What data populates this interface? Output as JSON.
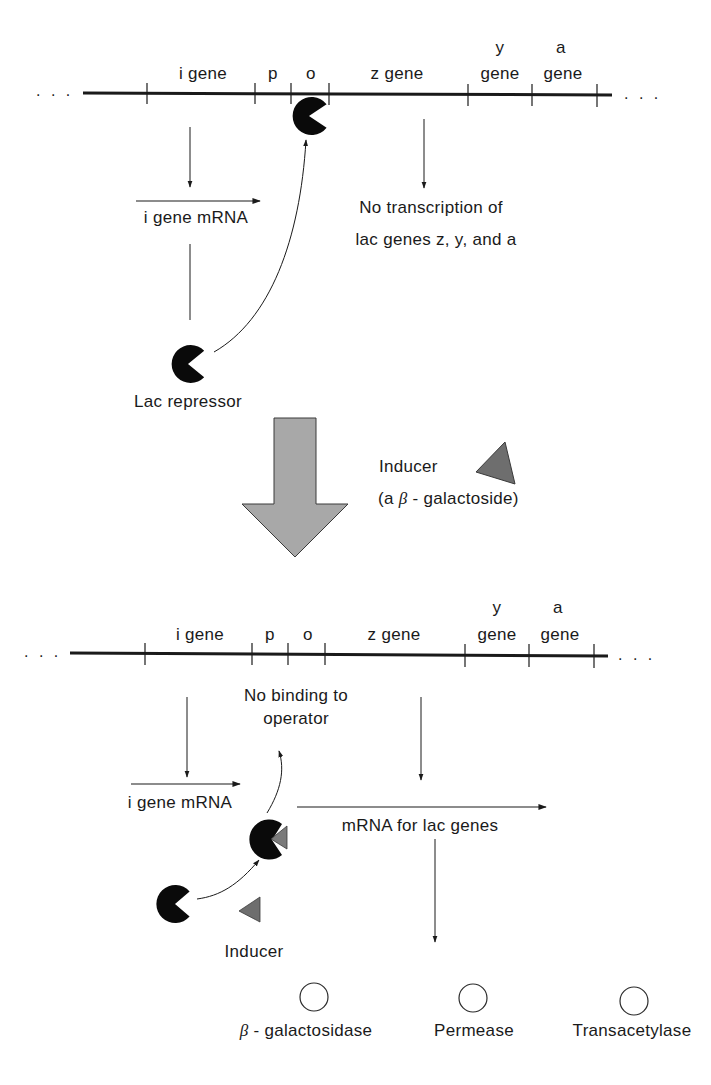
{
  "top_panel": {
    "state": "repressed",
    "dna_ends": {
      "left": ". . .",
      "right": ". . ."
    },
    "gene_labels": {
      "i": "i gene",
      "p": "p",
      "o": "o",
      "z": "z gene",
      "y_top": "y",
      "y_bottom": "gene",
      "a_top": "a",
      "a_bottom": "gene"
    },
    "i_mrna_label": "i gene mRNA",
    "repressor_label": "Lac repressor",
    "no_transcription_line1": "No transcription of",
    "no_transcription_line2": "lac genes z, y, and a"
  },
  "transition": {
    "inducer_label": "Inducer",
    "inducer_sublabel_prefix": "(a ",
    "inducer_sublabel_greek": "β",
    "inducer_sublabel_suffix": " - galactoside)",
    "arrow_color": "#a8a8a8",
    "inducer_color": "#6e6e6e"
  },
  "bottom_panel": {
    "state": "induced",
    "dna_ends": {
      "left": ". . .",
      "right": ". . ."
    },
    "gene_labels": {
      "i": "i gene",
      "p": "p",
      "o": "o",
      "z": "z gene",
      "y_top": "y",
      "y_bottom": "gene",
      "a_top": "a",
      "a_bottom": "gene"
    },
    "no_binding_line1": "No binding to",
    "no_binding_line2": "operator",
    "i_mrna_label": "i gene mRNA",
    "lac_mrna_label": "mRNA for lac genes",
    "inducer_label": "Inducer",
    "proteins": [
      {
        "greek": "β",
        "label": " - galactosidase"
      },
      {
        "greek": "",
        "label": "Permease"
      },
      {
        "greek": "",
        "label": "Transacetylase"
      }
    ]
  }
}
